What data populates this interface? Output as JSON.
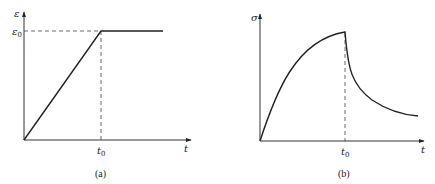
{
  "figure": {
    "panels": [
      {
        "id": "a",
        "caption": "(a)",
        "y_label": "ε",
        "x_label": "t",
        "y_mark_label": "ε",
        "y_mark_sub": "0",
        "x_mark_label": "t",
        "x_mark_sub": "0",
        "description": "Strain rises linearly from 0 to ε0 at t0, then stays constant"
      },
      {
        "id": "b",
        "caption": "(b)",
        "y_label": "σ",
        "x_label": "t",
        "x_mark_label": "t",
        "x_mark_sub": "0",
        "description": "Stress rises concavely to a peak at t0, then relaxes (decays) toward an asymptote"
      }
    ],
    "colors": {
      "line": "#222222",
      "dashed": "#444444",
      "background": "#ffffff"
    }
  }
}
